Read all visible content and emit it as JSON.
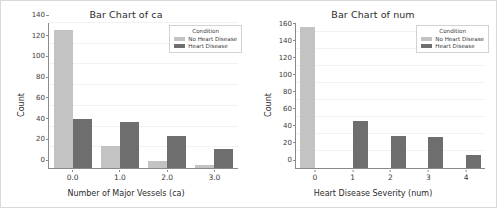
{
  "figure": {
    "background": "#ffffff",
    "border_color": "#d9d9d9"
  },
  "colors": {
    "no_heart_disease": "#c3c3c3",
    "heart_disease": "#6e6e6e",
    "axis": "#8a8a8a",
    "grid": "#f2f2f2",
    "text": "#2b2b2b"
  },
  "charts": [
    {
      "id": "bar-chart-ca",
      "title": "Bar Chart of ca",
      "xlabel": "Number of Major Vessels (ca)",
      "ylabel": "Count",
      "legend_title": "Condition",
      "legend": [
        "No Heart Disease",
        "Heart Disease"
      ],
      "yticks": [
        0,
        20,
        40,
        60,
        80,
        100,
        120,
        140
      ],
      "xticks": [
        "0.0",
        "1.0",
        "2.0",
        "3.0"
      ]
    },
    {
      "id": "bar-chart-num",
      "title": "Bar Chart of num",
      "xlabel": "Heart Disease Severity (num)",
      "ylabel": "Count",
      "legend_title": "Condition",
      "legend": [
        "No Heart Disease",
        "Heart Disease"
      ],
      "yticks": [
        0,
        20,
        40,
        60,
        80,
        100,
        120,
        140,
        160
      ],
      "xticks": [
        "0",
        "1",
        "2",
        "3",
        "4"
      ]
    }
  ],
  "chart_data": [
    {
      "type": "bar",
      "title": "Bar Chart of ca",
      "xlabel": "Number of Major Vessels (ca)",
      "ylabel": "Count",
      "categories": [
        "0.0",
        "1.0",
        "2.0",
        "3.0"
      ],
      "series": [
        {
          "name": "No Heart Disease",
          "color": "#c3c3c3",
          "values": [
            133,
            21,
            7,
            3
          ]
        },
        {
          "name": "Heart Disease",
          "color": "#6e6e6e",
          "values": [
            47,
            44,
            31,
            18
          ]
        }
      ],
      "ylim": [
        0,
        140
      ],
      "yticks": [
        0,
        20,
        40,
        60,
        80,
        100,
        120,
        140
      ],
      "grid": true,
      "legend_title": "Condition",
      "legend_position": "upper right"
    },
    {
      "type": "bar",
      "title": "Bar Chart of num",
      "xlabel": "Heart Disease Severity (num)",
      "ylabel": "Count",
      "categories": [
        "0",
        "1",
        "2",
        "3",
        "4"
      ],
      "series": [
        {
          "name": "No Heart Disease",
          "color": "#c3c3c3",
          "values": [
            165,
            0,
            0,
            0,
            0
          ]
        },
        {
          "name": "Heart Disease",
          "color": "#6e6e6e",
          "values": [
            0,
            55,
            37,
            36,
            15
          ]
        }
      ],
      "ylim": [
        0,
        170
      ],
      "yticks": [
        0,
        20,
        40,
        60,
        80,
        100,
        120,
        140,
        160
      ],
      "grid": true,
      "legend_title": "Condition",
      "legend_position": "upper right"
    }
  ]
}
